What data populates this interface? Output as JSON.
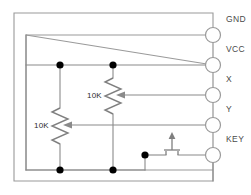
{
  "diagram": {
    "type": "circuit-schematic",
    "colors": {
      "background": "#ffffff",
      "wire": "#8a8a8a",
      "frame": "#9a9a9a",
      "component": "#7f7f7f",
      "node": "#000000",
      "label": "#4a4a4a",
      "value_label": "#2b2b2b"
    }
  },
  "terminals": [
    {
      "id": "gnd",
      "label": "GND",
      "cx": 213,
      "cy": 35,
      "label_x": 226,
      "label_y": 22
    },
    {
      "id": "vcc",
      "label": "VCC",
      "cx": 213,
      "cy": 65,
      "label_x": 226,
      "label_y": 52
    },
    {
      "id": "x",
      "label": "X",
      "cx": 213,
      "cy": 95,
      "label_x": 226,
      "label_y": 82
    },
    {
      "id": "y",
      "label": "Y",
      "cx": 213,
      "cy": 125,
      "label_x": 226,
      "label_y": 112
    },
    {
      "id": "key",
      "label": "KEY",
      "cx": 213,
      "cy": 155,
      "label_x": 226,
      "label_y": 142
    }
  ],
  "resistors": [
    {
      "id": "pot-x",
      "label": "10K",
      "value": "10K",
      "kind": "potentiometer",
      "x": 113,
      "top_y": 65,
      "bottom_y": 170,
      "label_x": 87,
      "label_y": 98,
      "wiper_from_terminal": "x",
      "wiper_y": 95
    },
    {
      "id": "pot-y",
      "label": "10K",
      "value": "10K",
      "kind": "potentiometer",
      "x": 60,
      "top_y": 65,
      "bottom_y": 170,
      "label_x": 34,
      "label_y": 128,
      "wiper_from_terminal": "y",
      "wiper_y": 125
    }
  ],
  "switch": {
    "id": "key-switch",
    "kind": "momentary-pushbutton",
    "x": 172,
    "y": 155,
    "node_x": 145,
    "node_y": 155
  },
  "nodes": [
    {
      "id": "n-vcc-poty",
      "x": 60,
      "y": 65,
      "r": 3.6
    },
    {
      "id": "n-vcc-potx",
      "x": 113,
      "y": 65,
      "r": 3.6
    },
    {
      "id": "n-gnd-poty",
      "x": 60,
      "y": 170,
      "r": 3.6
    },
    {
      "id": "n-gnd-potx",
      "x": 113,
      "y": 170,
      "r": 3.6
    },
    {
      "id": "n-key-sw",
      "x": 145,
      "y": 155,
      "r": 3.6
    }
  ],
  "frames": [
    {
      "id": "outer-frame",
      "x": 14,
      "y": 13,
      "width": 199,
      "height": 168
    },
    {
      "id": "inner-frame",
      "x": 26,
      "y": 35,
      "width": 187,
      "height": 135
    }
  ]
}
